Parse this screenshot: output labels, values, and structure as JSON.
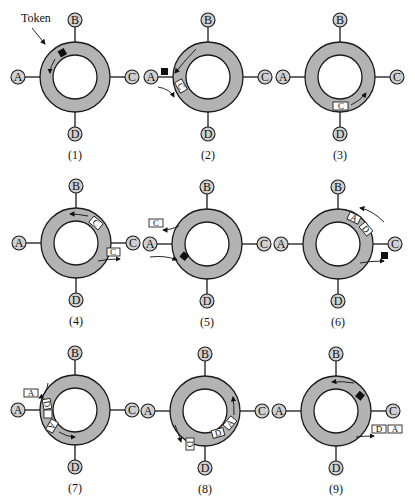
{
  "figure": {
    "token_label": "Token",
    "nodes": [
      "A",
      "B",
      "C",
      "D"
    ],
    "colors": {
      "ring": "#b3b3b3",
      "token": "#111111",
      "node": "#d0d0d0",
      "frame": "#ffffff"
    },
    "panels": [
      {
        "caption": "(1)",
        "description": "Free token circulating near A"
      },
      {
        "caption": "(2)",
        "description": "A seizes token and transmits frame addressed to C"
      },
      {
        "caption": "(3)",
        "description": "Frame C travels toward C"
      },
      {
        "caption": "(4)",
        "description": "C copies frame; frame continues"
      },
      {
        "caption": "(5)",
        "description": "A removes frame C and releases token"
      },
      {
        "caption": "(6)",
        "description": "C seizes token; frames D and A circulate"
      },
      {
        "caption": "(7)",
        "description": "A copies frame A"
      },
      {
        "caption": "(8)",
        "description": "D copies frame D"
      },
      {
        "caption": "(9)",
        "description": "C removes frames D and A, releases token"
      }
    ]
  }
}
